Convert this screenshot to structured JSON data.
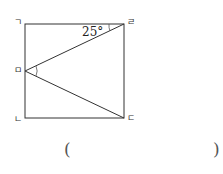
{
  "figure": {
    "shape": "square",
    "vertices": {
      "top_left": "ㄱ",
      "bottom_left": "ㄴ",
      "bottom_right": "ㄷ",
      "top_right": "ㄹ",
      "left_mid": "ㅁ"
    },
    "angle_label": "25°",
    "stroke_color": "#333333"
  },
  "answer_box": {
    "open_paren": "(",
    "close_paren": ")"
  }
}
